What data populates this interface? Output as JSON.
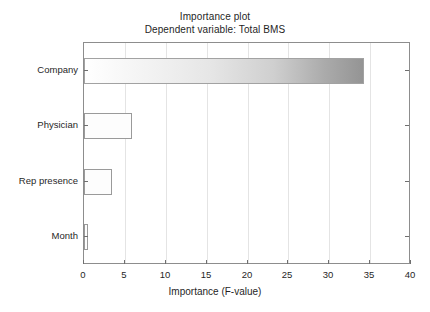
{
  "chart_data": {
    "type": "bar",
    "orientation": "horizontal",
    "title": "Importance plot",
    "subtitle": "Dependent variable: Total BMS",
    "xlabel": "Importance (F-value)",
    "ylabel": "",
    "categories": [
      "Company",
      "Physician",
      "Rep presence",
      "Month"
    ],
    "values": [
      34.3,
      5.9,
      3.4,
      0.5
    ],
    "xlim": [
      0,
      40
    ],
    "xticks": [
      0,
      5,
      10,
      15,
      20,
      25,
      30,
      35,
      40
    ],
    "xtick_labels": [
      "0",
      "5",
      "10",
      "15",
      "20",
      "25",
      "30",
      "35",
      "40"
    ],
    "grid": true,
    "grid_axis": "x",
    "legend": false,
    "bar_styles": [
      {
        "fill": "gradient",
        "gradient_from": "#ffffff",
        "gradient_to": "#949494",
        "border": "#a2a2a2"
      },
      {
        "fill": "#fdfdfd",
        "border": "#9a9a9a"
      },
      {
        "fill": "#fdfdfd",
        "border": "#9a9a9a"
      },
      {
        "fill": "#fdfdfd",
        "border": "#9a9a9a"
      }
    ]
  },
  "colors": {
    "frame": "#8d8d8d",
    "gridline": "#e4e4e4",
    "tick": "#6f6f6f",
    "text": "#1f1f1f",
    "background": "#ffffff"
  }
}
